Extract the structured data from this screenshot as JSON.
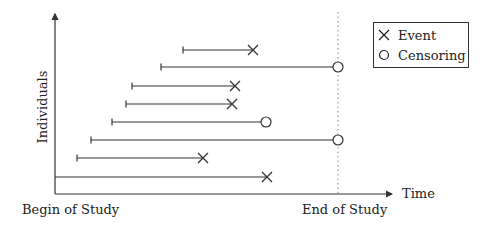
{
  "diagram": {
    "type": "survival-censoring-timeline",
    "y_axis_label": "Individuals",
    "x_axis_label": "Time",
    "x_start_label": "Begin of Study",
    "x_end_label": "End of Study",
    "legend": {
      "items": [
        {
          "marker": "cross",
          "label": "Event"
        },
        {
          "marker": "circle",
          "label": "Censoring"
        }
      ]
    },
    "individuals": [
      {
        "start_x": 183,
        "end_x": 253,
        "y": 50,
        "outcome": "event"
      },
      {
        "start_x": 161,
        "end_x": 338,
        "y": 67,
        "outcome": "censoring"
      },
      {
        "start_x": 132,
        "end_x": 235,
        "y": 86,
        "outcome": "event"
      },
      {
        "start_x": 126,
        "end_x": 232,
        "y": 104,
        "outcome": "event"
      },
      {
        "start_x": 112,
        "end_x": 266,
        "y": 122,
        "outcome": "censoring"
      },
      {
        "start_x": 91,
        "end_x": 338,
        "y": 140,
        "outcome": "censoring"
      },
      {
        "start_x": 77,
        "end_x": 203,
        "y": 158,
        "outcome": "event"
      },
      {
        "start_x": 55,
        "end_x": 267,
        "y": 177,
        "outcome": "event"
      }
    ],
    "colors": {
      "line": "#333333",
      "dotted": "#888888"
    }
  }
}
